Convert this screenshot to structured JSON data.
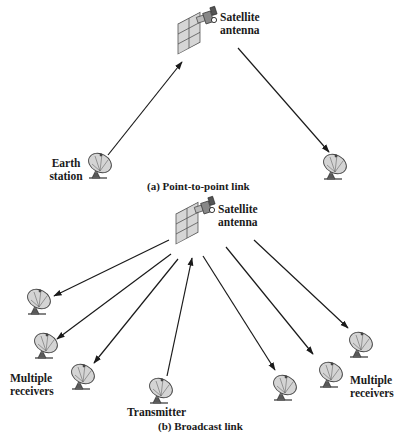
{
  "figure": {
    "part_a": {
      "caption": "(a) Point-to-point link",
      "satellite_label_line1": "Satellite",
      "satellite_label_line2": "antenna",
      "earth_station_label_line1": "Earth",
      "earth_station_label_line2": "station",
      "nodes": [
        {
          "name": "satellite-antenna",
          "icon": "satellite-icon"
        },
        {
          "name": "earth-station",
          "icon": "dish-antenna-icon"
        },
        {
          "name": "receiving-station",
          "icon": "dish-antenna-icon"
        }
      ],
      "links": [
        {
          "from": "earth-station",
          "to": "satellite-antenna"
        },
        {
          "from": "satellite-antenna",
          "to": "receiving-station"
        }
      ]
    },
    "part_b": {
      "caption": "(b) Broadcast link",
      "satellite_label_line1": "Satellite",
      "satellite_label_line2": "antenna",
      "transmitter_label": "Transmitter",
      "left_receivers_label_line1": "Multiple",
      "left_receivers_label_line2": "receivers",
      "right_receivers_label_line1": "Multiple",
      "right_receivers_label_line2": "receivers",
      "receiver_count": 6,
      "links": [
        {
          "from": "transmitter",
          "to": "satellite-antenna"
        },
        {
          "from": "satellite-antenna",
          "to": "receiver-1"
        },
        {
          "from": "satellite-antenna",
          "to": "receiver-2"
        },
        {
          "from": "satellite-antenna",
          "to": "receiver-3"
        },
        {
          "from": "satellite-antenna",
          "to": "receiver-4"
        },
        {
          "from": "satellite-antenna",
          "to": "receiver-5"
        },
        {
          "from": "satellite-antenna",
          "to": "receiver-6"
        }
      ]
    }
  }
}
